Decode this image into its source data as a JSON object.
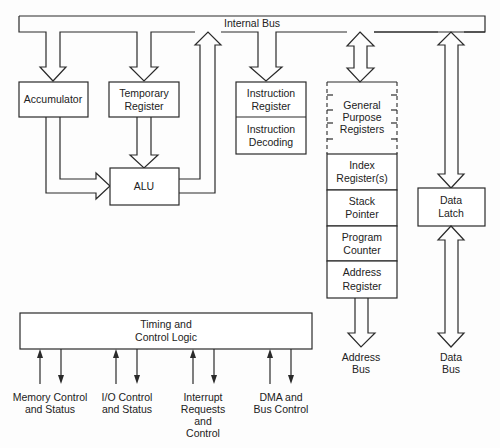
{
  "diagram": {
    "internal_bus": {
      "label": "Internal Bus"
    },
    "accumulator": {
      "label": "Accumulator"
    },
    "temporary_register": {
      "line1": "Temporary",
      "line2": "Register"
    },
    "alu": {
      "label": "ALU"
    },
    "instruction_register": {
      "line1": "Instruction",
      "line2": "Register"
    },
    "instruction_decoding": {
      "line1": "Instruction",
      "line2": "Decoding"
    },
    "general_purpose_registers": {
      "line1": "General",
      "line2": "Purpose",
      "line3": "Registers"
    },
    "index_registers": {
      "line1": "Index",
      "line2": "Register(s)"
    },
    "stack_pointer": {
      "line1": "Stack",
      "line2": "Pointer"
    },
    "program_counter": {
      "line1": "Program",
      "line2": "Counter"
    },
    "address_register": {
      "line1": "Address",
      "line2": "Register"
    },
    "data_latch": {
      "line1": "Data",
      "line2": "Latch"
    },
    "address_bus": {
      "line1": "Address",
      "line2": "Bus"
    },
    "data_bus": {
      "line1": "Data",
      "line2": "Bus"
    },
    "timing_control": {
      "line1": "Timing and",
      "line2": "Control Logic"
    },
    "control_signals": [
      {
        "line1": "Memory Control",
        "line2": "and Status"
      },
      {
        "line1": "I/O Control",
        "line2": "and Status"
      },
      {
        "line1": "Interrupt",
        "line2": "Requests",
        "line3": "and",
        "line4": "Control"
      },
      {
        "line1": "DMA and",
        "line2": "Bus Control"
      }
    ]
  }
}
